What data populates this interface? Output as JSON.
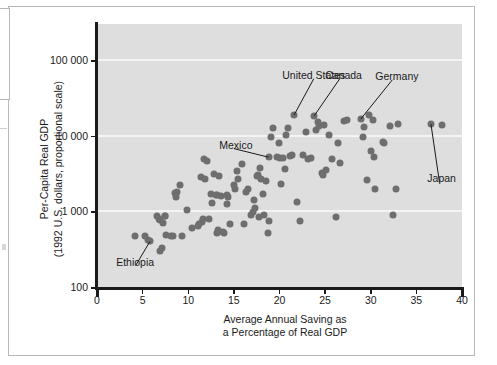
{
  "chart_data": {
    "type": "scatter",
    "title": "",
    "xlabel": "Average Annual Saving as a Percentage of Real GDP",
    "xlabel_line1": "Average Annual Saving as",
    "xlabel_line2": "a Percentage of Real GDP",
    "ylabel": "Per-Capita Real GDP (1992 U.S. dollars, proportional scale)",
    "ylabel_line1": "Per-Capita Real GDP",
    "ylabel_line2": "(1992 U.S. dollars, proportional scale)",
    "xlim": [
      0,
      40
    ],
    "ylim": [
      100,
      300000
    ],
    "yscale": "log",
    "grid": true,
    "grid_color": "#f4f4f4",
    "plot_bg": "#dedede",
    "point_color": "#6e6e6e",
    "legend": null,
    "xticks": [
      0,
      5,
      10,
      15,
      20,
      25,
      30,
      35,
      40
    ],
    "xticklabels": [
      "0",
      "5",
      "10",
      "15",
      "20",
      "25",
      "30",
      "35",
      "40"
    ],
    "yticks": [
      100,
      1000,
      10000,
      100000
    ],
    "yticklabels": [
      "100",
      "1 000",
      "10 000",
      "100 000"
    ],
    "annotations": [
      {
        "label": "United States",
        "x": 21.6,
        "y": 18800,
        "text_x": 20.3,
        "text_y": 62000
      },
      {
        "label": "Canada",
        "x": 23.8,
        "y": 18300,
        "text_x": 25.0,
        "text_y": 62000
      },
      {
        "label": "Germany",
        "x": 28.9,
        "y": 16600,
        "text_x": 30.5,
        "text_y": 60000
      },
      {
        "label": "Mexico",
        "x": 18.8,
        "y": 5200,
        "text_x": 13.4,
        "text_y": 7400
      },
      {
        "label": "Japan",
        "x": 36.6,
        "y": 14200,
        "text_x": 36.2,
        "text_y": 2650
      },
      {
        "label": "Ethiopia",
        "x": 5.8,
        "y": 400,
        "text_x": 2.1,
        "text_y": 210
      }
    ],
    "points": [
      [
        4.2,
        470
      ],
      [
        5.3,
        470
      ],
      [
        5.6,
        420
      ],
      [
        5.8,
        400
      ],
      [
        6.6,
        880
      ],
      [
        6.8,
        790
      ],
      [
        6.9,
        760
      ],
      [
        6.9,
        300
      ],
      [
        7.1,
        330
      ],
      [
        7.2,
        700
      ],
      [
        7.4,
        870
      ],
      [
        7.5,
        880
      ],
      [
        7.6,
        480
      ],
      [
        8.1,
        470
      ],
      [
        8.3,
        470
      ],
      [
        8.6,
        1750
      ],
      [
        8.7,
        1560
      ],
      [
        8.8,
        1800
      ],
      [
        9.1,
        2260
      ],
      [
        9.3,
        470
      ],
      [
        9.9,
        1030
      ],
      [
        10.4,
        610
      ],
      [
        11.1,
        650
      ],
      [
        11.2,
        690
      ],
      [
        11.4,
        2850
      ],
      [
        11.5,
        720
      ],
      [
        11.6,
        800
      ],
      [
        11.7,
        4900
      ],
      [
        11.8,
        2700
      ],
      [
        12.0,
        4600
      ],
      [
        12.3,
        800
      ],
      [
        12.5,
        1700
      ],
      [
        12.6,
        1280
      ],
      [
        12.8,
        3100
      ],
      [
        13.0,
        1650
      ],
      [
        13.1,
        520
      ],
      [
        13.2,
        1640
      ],
      [
        13.3,
        560
      ],
      [
        13.4,
        2900
      ],
      [
        13.6,
        1610
      ],
      [
        13.8,
        530
      ],
      [
        13.9,
        520
      ],
      [
        14.2,
        1240
      ],
      [
        14.3,
        1640
      ],
      [
        14.4,
        1560
      ],
      [
        14.6,
        690
      ],
      [
        15.0,
        2250
      ],
      [
        15.1,
        1950
      ],
      [
        15.3,
        3450
      ],
      [
        15.5,
        2700
      ],
      [
        15.9,
        4200
      ],
      [
        16.1,
        690
      ],
      [
        16.3,
        1830
      ],
      [
        16.6,
        2000
      ],
      [
        16.9,
        900
      ],
      [
        17.1,
        980
      ],
      [
        17.2,
        1420
      ],
      [
        17.3,
        1120
      ],
      [
        17.5,
        2950
      ],
      [
        17.6,
        3000
      ],
      [
        17.8,
        830
      ],
      [
        17.9,
        3800
      ],
      [
        18.0,
        2650
      ],
      [
        18.2,
        1700
      ],
      [
        18.3,
        900
      ],
      [
        18.5,
        2550
      ],
      [
        18.7,
        520
      ],
      [
        18.8,
        5200
      ],
      [
        18.9,
        740
      ],
      [
        19.1,
        9600
      ],
      [
        19.3,
        12500
      ],
      [
        19.7,
        5200
      ],
      [
        19.9,
        7900
      ],
      [
        20.1,
        5100
      ],
      [
        20.2,
        2300
      ],
      [
        20.4,
        5000
      ],
      [
        20.6,
        3650
      ],
      [
        20.7,
        10300
      ],
      [
        20.9,
        12800
      ],
      [
        21.2,
        5400
      ],
      [
        21.4,
        5600
      ],
      [
        21.6,
        18800
      ],
      [
        21.9,
        1350
      ],
      [
        22.3,
        750
      ],
      [
        22.6,
        5600
      ],
      [
        22.9,
        11200
      ],
      [
        23.1,
        4900
      ],
      [
        23.4,
        5100
      ],
      [
        23.8,
        18300
      ],
      [
        24.0,
        12000
      ],
      [
        24.2,
        15000
      ],
      [
        24.3,
        13500
      ],
      [
        24.7,
        3200
      ],
      [
        24.8,
        3050
      ],
      [
        24.9,
        13800
      ],
      [
        25.1,
        3500
      ],
      [
        25.4,
        10300
      ],
      [
        25.8,
        4900
      ],
      [
        26.2,
        850
      ],
      [
        26.4,
        7900
      ],
      [
        26.6,
        4400
      ],
      [
        27.1,
        15800
      ],
      [
        27.4,
        16000
      ],
      [
        28.9,
        16600
      ],
      [
        29.1,
        9500
      ],
      [
        29.3,
        13000
      ],
      [
        29.6,
        2600
      ],
      [
        29.8,
        18700
      ],
      [
        30.0,
        6200
      ],
      [
        30.2,
        16200
      ],
      [
        30.4,
        5200
      ],
      [
        30.5,
        2000
      ],
      [
        31.3,
        8200
      ],
      [
        31.5,
        8100
      ],
      [
        32.1,
        13500
      ],
      [
        32.4,
        900
      ],
      [
        32.8,
        1950
      ],
      [
        33.0,
        14500
      ],
      [
        36.6,
        14200
      ],
      [
        37.8,
        13800
      ]
    ]
  }
}
